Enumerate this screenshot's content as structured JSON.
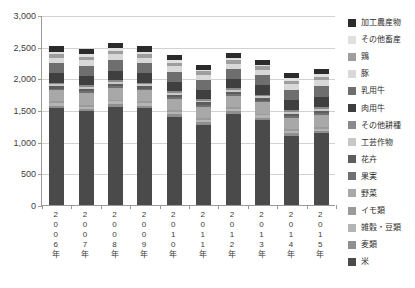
{
  "chart_data": {
    "type": "bar",
    "subtype": "stacked-vertical",
    "title": "",
    "xlabel": "",
    "ylabel": "",
    "ylim": [
      0,
      3000
    ],
    "ytick_labels": [
      "0",
      "500",
      "1,000",
      "1,500",
      "2,000",
      "2,500",
      "3,000"
    ],
    "ytick_values": [
      0,
      500,
      1000,
      1500,
      2000,
      2500,
      3000
    ],
    "grid": true,
    "legend_position": "right",
    "categories": [
      "2006年",
      "2007年",
      "2008年",
      "2009年",
      "2010年",
      "2011年",
      "2012年",
      "2013年",
      "2014年",
      "2015年"
    ],
    "series": [
      {
        "name": "米",
        "color": "#4a4a4a",
        "values": [
          1530,
          1480,
          1555,
          1530,
          1390,
          1270,
          1440,
          1340,
          1090,
          1130
        ]
      },
      {
        "name": "麦類",
        "color": "#8f8f8f",
        "values": [
          40,
          40,
          45,
          40,
          40,
          40,
          40,
          40,
          40,
          40
        ]
      },
      {
        "name": "雑穀・豆類",
        "color": "#b5b5b5",
        "values": [
          35,
          35,
          35,
          35,
          35,
          35,
          35,
          35,
          35,
          35
        ]
      },
      {
        "name": "イモ類",
        "color": "#9b9b9b",
        "values": [
          30,
          30,
          30,
          30,
          30,
          30,
          30,
          30,
          30,
          30
        ]
      },
      {
        "name": "野菜",
        "color": "#a8a8a8",
        "values": [
          175,
          180,
          180,
          175,
          175,
          175,
          175,
          175,
          180,
          185
        ]
      },
      {
        "name": "果実",
        "color": "#707070",
        "values": [
          30,
          30,
          30,
          30,
          30,
          30,
          30,
          30,
          30,
          30
        ]
      },
      {
        "name": "花卉",
        "color": "#5d5d5d",
        "values": [
          40,
          40,
          40,
          40,
          40,
          40,
          40,
          40,
          40,
          40
        ]
      },
      {
        "name": "工芸作物",
        "color": "#c8c8c8",
        "values": [
          30,
          30,
          30,
          30,
          30,
          30,
          30,
          30,
          30,
          30
        ]
      },
      {
        "name": "その他耕種",
        "color": "#8a8a8a",
        "values": [
          25,
          25,
          25,
          25,
          25,
          25,
          25,
          25,
          25,
          25
        ]
      },
      {
        "name": "肉用牛",
        "color": "#3f3f3f",
        "values": [
          150,
          150,
          155,
          150,
          150,
          145,
          150,
          150,
          155,
          165
        ]
      },
      {
        "name": "乳用牛",
        "color": "#6e6e6e",
        "values": [
          155,
          155,
          160,
          155,
          155,
          150,
          155,
          155,
          160,
          165
        ]
      },
      {
        "name": "豚",
        "color": "#d8d8d8",
        "values": [
          90,
          90,
          95,
          90,
          90,
          85,
          85,
          85,
          90,
          95
        ]
      },
      {
        "name": "鶏",
        "color": "#9e9e9e",
        "values": [
          60,
          60,
          60,
          60,
          60,
          55,
          55,
          55,
          60,
          60
        ]
      },
      {
        "name": "その他畜産",
        "color": "#e0e0e0",
        "values": [
          35,
          35,
          35,
          35,
          35,
          30,
          30,
          30,
          35,
          35
        ]
      },
      {
        "name": "加工農産物",
        "color": "#2b2b2b",
        "values": [
          80,
          80,
          80,
          80,
          80,
          75,
          75,
          75,
          80,
          80
        ]
      }
    ],
    "legend_entries_top_to_bottom": [
      "加工農産物",
      "その他畜産",
      "鶏",
      "豚",
      "乳用牛",
      "肉用牛",
      "その他耕種",
      "工芸作物",
      "花卉",
      "果実",
      "野菜",
      "イモ類",
      "雑穀・豆類",
      "麦類",
      "米"
    ],
    "legend_colors_top_to_bottom": [
      "#2b2b2b",
      "#e0e0e0",
      "#9e9e9e",
      "#d8d8d8",
      "#6e6e6e",
      "#3f3f3f",
      "#8a8a8a",
      "#c8c8c8",
      "#5d5d5d",
      "#707070",
      "#a8a8a8",
      "#9b9b9b",
      "#b5b5b5",
      "#8f8f8f",
      "#4a4a4a"
    ]
  }
}
